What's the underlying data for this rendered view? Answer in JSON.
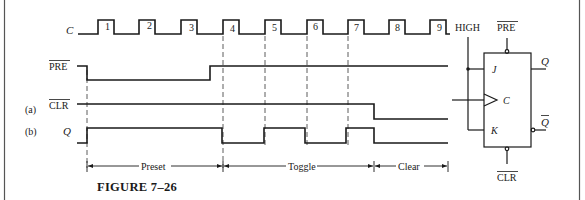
{
  "figure": {
    "caption": "FIGURE 7–26",
    "colors": {
      "ink": "#1a1a1a",
      "background": "#ffffff",
      "dashes": "#333333"
    }
  },
  "timing": {
    "signals": [
      {
        "id": "clock",
        "label": "C",
        "overbar": false,
        "italic": true,
        "prefix": ""
      },
      {
        "id": "pre",
        "label": "PRE",
        "overbar": true,
        "italic": false,
        "prefix": ""
      },
      {
        "id": "clr",
        "label": "CLR",
        "overbar": true,
        "italic": false,
        "prefix": "(a)"
      },
      {
        "id": "q",
        "label": "Q",
        "overbar": false,
        "italic": true,
        "prefix": "(b)"
      }
    ],
    "clock_pulses": [
      "1",
      "2",
      "3",
      "4",
      "5",
      "6",
      "7",
      "8",
      "9"
    ],
    "intervals": [
      {
        "label": "Preset",
        "from_pulse": "start",
        "to_pulse": "4"
      },
      {
        "label": "Toggle",
        "from_pulse": "4",
        "to_pulse": "7 (falling CLR)"
      },
      {
        "label": "Clear",
        "from_pulse": "CLR low",
        "to_pulse": "end"
      }
    ],
    "waveforms": {
      "pre": "HIGH → LOW at start, LOW through pulses 1–3, HIGH before pulse 4 onward",
      "clr": "HIGH through pulse 7, LOW after pulse 7",
      "q": "LOW → HIGH at start (preset), LOW at pulse 4, HIGH at 5, LOW at 6, HIGH at 7, LOW when CLR goes low"
    }
  },
  "flipflop": {
    "high_label": "HIGH",
    "pre_label": "PRE",
    "clr_label": "CLR",
    "inputs": {
      "j": "J",
      "clk": "C",
      "k": "K"
    },
    "outputs": {
      "q": "Q",
      "qbar": "Q"
    }
  }
}
